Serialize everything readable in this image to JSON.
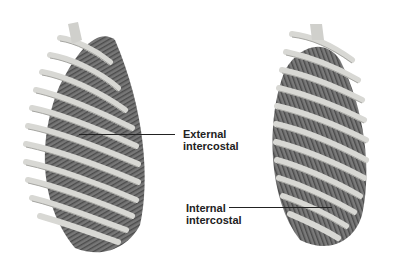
{
  "figure": {
    "labels": {
      "external": {
        "line1": "External",
        "line2": "intercostal"
      },
      "internal": {
        "line1": "Internal",
        "line2": "intercostal"
      }
    },
    "colors": {
      "background": "#ffffff",
      "rib": "#d6d6d2",
      "rib_shadow": "#9a9a96",
      "muscle": "#6e6e6e",
      "muscle_dark": "#4a4a4a",
      "text": "#222222"
    }
  }
}
